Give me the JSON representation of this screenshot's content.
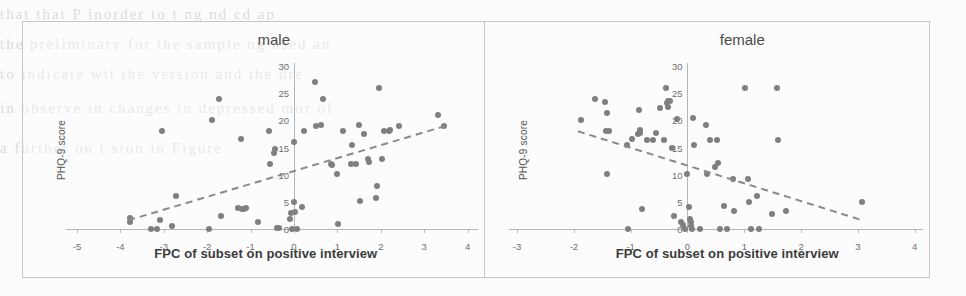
{
  "figure": {
    "background_color": "#fbfbfa",
    "frame_color": "#c4c6c8",
    "point_color": "#7f7f7f",
    "trendline_color": "#8a8a8a"
  },
  "bleed_through_text": [
    "that that P  inorder to t ng  nd  cd  ap",
    "the  preliminary  for  the  sample  ng  used  an",
    "to  indicate  wit  the  version  and  the  ure",
    "in  observe  in  changes  in  depressed  mor  of",
    "a  further  on  t sion  in  Figure"
  ],
  "panels": [
    {
      "id": "male",
      "title": "male",
      "ylabel": "PHQ-9 score",
      "xlabel": "FPC of subset on positive interview",
      "x_ticks": [
        "-5",
        "-4",
        "-3",
        "-2",
        "-1",
        "0",
        "1",
        "2",
        "3",
        "4"
      ],
      "x_tick_values": [
        -5,
        -4,
        -3,
        -2,
        -1,
        0,
        1,
        2,
        3,
        4
      ],
      "y_ticks": [
        "0",
        "5",
        "10",
        "15",
        "20",
        "25",
        "30"
      ],
      "y_tick_values": [
        0,
        5,
        10,
        15,
        20,
        25,
        30
      ]
    },
    {
      "id": "female",
      "title": "female",
      "ylabel": "PHQ-9 score",
      "xlabel": "FPC of subset on positive interview",
      "x_ticks": [
        "-3",
        "-2",
        "-1",
        "0",
        "1",
        "2",
        "3",
        "4"
      ],
      "x_tick_values": [
        -3,
        -2,
        -1,
        0,
        1,
        2,
        3,
        4
      ],
      "y_ticks": [
        "0",
        "5",
        "10",
        "15",
        "20",
        "25",
        "30"
      ],
      "y_tick_values": [
        0,
        5,
        10,
        15,
        20,
        25,
        30
      ]
    }
  ],
  "chart_data": [
    {
      "type": "scatter",
      "title": "male",
      "xlabel": "FPC of subset on positive interview",
      "ylabel": "PHQ-9 score",
      "xlim": [
        -5.2,
        4.2
      ],
      "ylim": [
        0,
        31
      ],
      "xticks": [
        -5,
        -4,
        -3,
        -2,
        -1,
        0,
        1,
        2,
        3,
        4
      ],
      "yticks": [
        0,
        5,
        10,
        15,
        20,
        25,
        30
      ],
      "grid": false,
      "legend": "none",
      "points": [
        [
          -3.78,
          2.0
        ],
        [
          -3.78,
          1.2
        ],
        [
          -3.3,
          0.0
        ],
        [
          -3.15,
          0.0
        ],
        [
          -3.08,
          1.6
        ],
        [
          -3.05,
          18.0
        ],
        [
          -2.82,
          0.6
        ],
        [
          -2.72,
          6.0
        ],
        [
          -1.95,
          0.0
        ],
        [
          -1.9,
          20.0
        ],
        [
          -1.72,
          24.0
        ],
        [
          -1.68,
          2.4
        ],
        [
          -1.22,
          16.5
        ],
        [
          -1.28,
          3.8
        ],
        [
          -1.2,
          3.6
        ],
        [
          -1.16,
          3.6
        ],
        [
          -1.1,
          3.8
        ],
        [
          -0.82,
          1.2
        ],
        [
          -0.58,
          18.0
        ],
        [
          -0.55,
          12.0
        ],
        [
          -0.46,
          14.0
        ],
        [
          -0.44,
          14.8
        ],
        [
          -0.4,
          0.1
        ],
        [
          -0.34,
          0.1
        ],
        [
          -0.1,
          1.9
        ],
        [
          -0.08,
          3.0
        ],
        [
          -0.05,
          0.0
        ],
        [
          0.0,
          16.0
        ],
        [
          0.0,
          5.0
        ],
        [
          0.02,
          3.2
        ],
        [
          0.06,
          0.0
        ],
        [
          0.18,
          4.1
        ],
        [
          0.22,
          18.0
        ],
        [
          0.48,
          27.0
        ],
        [
          0.5,
          19.0
        ],
        [
          0.66,
          24.0
        ],
        [
          0.62,
          19.2
        ],
        [
          0.86,
          12.0
        ],
        [
          0.88,
          11.8
        ],
        [
          0.98,
          10.2
        ],
        [
          1.02,
          0.9
        ],
        [
          1.12,
          18.0
        ],
        [
          1.34,
          15.5
        ],
        [
          1.32,
          12.0
        ],
        [
          1.42,
          12.0
        ],
        [
          1.5,
          19.2
        ],
        [
          1.52,
          5.2
        ],
        [
          1.62,
          17.5
        ],
        [
          1.7,
          12.8
        ],
        [
          1.72,
          12.4
        ],
        [
          1.88,
          5.8
        ],
        [
          1.92,
          8.0
        ],
        [
          1.96,
          26.0
        ],
        [
          2.02,
          12.8
        ],
        [
          2.08,
          18.0
        ],
        [
          2.18,
          18.0
        ],
        [
          2.22,
          18.2
        ],
        [
          2.42,
          19.0
        ],
        [
          3.32,
          21.0
        ],
        [
          3.46,
          19.0
        ]
      ],
      "trendline": {
        "x0": -3.82,
        "y0": 1.6,
        "x1": 3.5,
        "y1": 19.0,
        "style": "dashed",
        "slope_sign": "positive"
      }
    },
    {
      "type": "scatter",
      "title": "female",
      "xlabel": "FPC of subset on positive interview",
      "ylabel": "PHQ-9 score",
      "xlim": [
        -3.1,
        4.1
      ],
      "ylim": [
        0,
        31
      ],
      "xticks": [
        -3,
        -2,
        -1,
        0,
        1,
        2,
        3,
        4
      ],
      "yticks": [
        0,
        5,
        10,
        15,
        20,
        25,
        30
      ],
      "grid": false,
      "legend": "none",
      "points": [
        [
          -1.88,
          20.0
        ],
        [
          -1.62,
          24.0
        ],
        [
          -1.46,
          23.4
        ],
        [
          -1.42,
          21.4
        ],
        [
          -1.44,
          18.0
        ],
        [
          -1.38,
          18.0
        ],
        [
          -1.42,
          10.2
        ],
        [
          -1.06,
          15.4
        ],
        [
          -1.04,
          0.0
        ],
        [
          -0.98,
          16.5
        ],
        [
          -0.88,
          17.5
        ],
        [
          -0.86,
          22.0
        ],
        [
          -0.84,
          18.2
        ],
        [
          -0.84,
          17.6
        ],
        [
          -0.8,
          3.6
        ],
        [
          -0.72,
          16.4
        ],
        [
          -0.6,
          16.4
        ],
        [
          -0.56,
          17.6
        ],
        [
          -0.48,
          22.2
        ],
        [
          -0.42,
          16.4
        ],
        [
          -0.38,
          26.0
        ],
        [
          -0.36,
          23.2
        ],
        [
          -0.34,
          23.6
        ],
        [
          -0.34,
          22.4
        ],
        [
          -0.3,
          23.6
        ],
        [
          -0.28,
          15.0
        ],
        [
          -0.24,
          2.4
        ],
        [
          -0.18,
          20.2
        ],
        [
          -0.12,
          1.2
        ],
        [
          -0.08,
          0.7
        ],
        [
          -0.05,
          0.0
        ],
        [
          0.0,
          10.2
        ],
        [
          0.02,
          4.0
        ],
        [
          0.04,
          1.9
        ],
        [
          0.06,
          1.2
        ],
        [
          0.06,
          0.6
        ],
        [
          0.08,
          0.0
        ],
        [
          0.1,
          20.4
        ],
        [
          0.12,
          15.4
        ],
        [
          0.22,
          0.0
        ],
        [
          0.32,
          19.2
        ],
        [
          0.34,
          10.2
        ],
        [
          0.4,
          16.4
        ],
        [
          0.48,
          11.4
        ],
        [
          0.52,
          16.4
        ],
        [
          0.54,
          12.2
        ],
        [
          0.58,
          0.0
        ],
        [
          0.64,
          4.2
        ],
        [
          0.7,
          0.0
        ],
        [
          0.8,
          9.2
        ],
        [
          0.82,
          3.4
        ],
        [
          1.02,
          26.0
        ],
        [
          1.06,
          9.2
        ],
        [
          1.08,
          5.0
        ],
        [
          1.12,
          0.0
        ],
        [
          1.22,
          6.0
        ],
        [
          1.26,
          0.0
        ],
        [
          1.48,
          2.8
        ],
        [
          1.58,
          26.0
        ],
        [
          1.6,
          16.4
        ],
        [
          1.74,
          3.4
        ],
        [
          3.08,
          5.0
        ]
      ],
      "trendline": {
        "x0": -1.92,
        "y0": 18.0,
        "x1": 3.12,
        "y1": 1.5,
        "style": "dashed",
        "slope_sign": "negative"
      }
    }
  ]
}
